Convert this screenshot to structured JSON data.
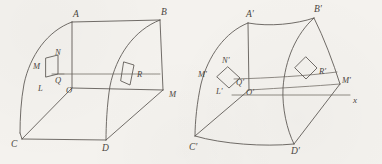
{
  "figure": {
    "type": "geometry-diagram",
    "background_color": "#f4f2ee",
    "ink_color": "#58544f",
    "width": 382,
    "height": 164
  },
  "left_figure": {
    "name": "undeformed-solid",
    "labels": [
      {
        "id": "A",
        "text": "A",
        "x": 73,
        "y": 10
      },
      {
        "id": "B",
        "text": "B",
        "x": 161,
        "y": 8
      },
      {
        "id": "N",
        "text": "N",
        "x": 55,
        "y": 50
      },
      {
        "id": "M",
        "text": "M",
        "x": 35,
        "y": 66
      },
      {
        "id": "Q",
        "text": "Q",
        "x": 54,
        "y": 79
      },
      {
        "id": "L",
        "text": "L",
        "x": 38,
        "y": 87
      },
      {
        "id": "O",
        "text": "O",
        "x": 65,
        "y": 88
      },
      {
        "id": "R",
        "text": "R",
        "x": 136,
        "y": 72
      },
      {
        "id": "M2",
        "text": "M",
        "x": 169,
        "y": 92
      },
      {
        "id": "C",
        "text": "C",
        "x": 11,
        "y": 142
      },
      {
        "id": "D",
        "text": "D",
        "x": 101,
        "y": 147
      }
    ]
  },
  "right_figure": {
    "name": "deformed-solid",
    "labels": [
      {
        "id": "A'",
        "text": "A′",
        "x": 248,
        "y": 11
      },
      {
        "id": "B'",
        "text": "B′",
        "x": 315,
        "y": 6
      },
      {
        "id": "N'",
        "text": "N′",
        "x": 222,
        "y": 58
      },
      {
        "id": "M'",
        "text": "M′",
        "x": 198,
        "y": 72
      },
      {
        "id": "Q'",
        "text": "Q′",
        "x": 235,
        "y": 80
      },
      {
        "id": "L'",
        "text": "L′",
        "x": 216,
        "y": 89
      },
      {
        "id": "O'",
        "text": "O′",
        "x": 245,
        "y": 90
      },
      {
        "id": "R'",
        "text": "R′",
        "x": 314,
        "y": 71
      },
      {
        "id": "M2'",
        "text": "M′",
        "x": 341,
        "y": 77
      },
      {
        "id": "C'",
        "text": "C′",
        "x": 191,
        "y": 145
      },
      {
        "id": "D'",
        "text": "D′",
        "x": 290,
        "y": 150
      }
    ],
    "axis_label": {
      "id": "x",
      "text": "x",
      "x": 353,
      "y": 97
    }
  }
}
